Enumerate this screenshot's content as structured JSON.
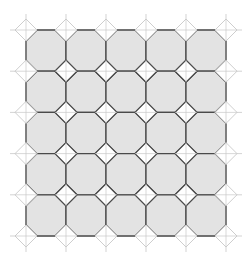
{
  "figure": {
    "rows": 5,
    "cols": 5,
    "origin": [
      26,
      30
    ],
    "cell_w": 40,
    "cell_h": 41.2,
    "corner_cut": 11,
    "colors": {
      "octagon_fill": "#e3e3e3",
      "edge": "#4a4a4a",
      "diamond_fill": "#ffffff",
      "guide": "#c8c8c8",
      "background": "#ffffff"
    }
  }
}
